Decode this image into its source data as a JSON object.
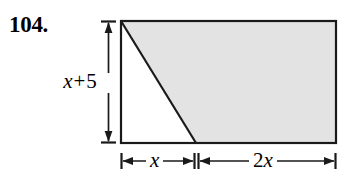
{
  "figure": {
    "problem_number": "104.",
    "shape": "trapezoid-in-rectangle",
    "labels": {
      "height": {
        "full": "x + 5",
        "variable": "x",
        "operator": "+",
        "constant": "5"
      },
      "bottom_left": {
        "full": "x",
        "coefficient": "",
        "variable": "x"
      },
      "bottom_right": {
        "full": "2x",
        "coefficient": "2",
        "variable": "x"
      }
    },
    "colors": {
      "shading": "#e3e3e3",
      "outline": "#1a1a1a",
      "background": "#ffffff",
      "text": "#000000"
    },
    "geometry": {
      "rect_left": 121,
      "rect_top": 21,
      "rect_right": 336,
      "rect_bottom": 143,
      "diagonal_top_x": 121,
      "diagonal_bottom_x": 196,
      "height_arrow_x": 108,
      "bottom_dim_y": 161,
      "bottom_dim_mid_x": 196
    }
  }
}
